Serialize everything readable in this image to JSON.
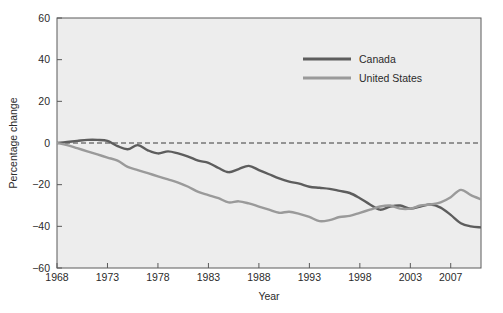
{
  "chart_data": {
    "type": "line",
    "title": "",
    "xlabel": "Year",
    "ylabel": "Percentage change",
    "xlim": [
      1968,
      2010
    ],
    "ylim": [
      -60,
      60
    ],
    "grid": false,
    "legend_position": "top-right",
    "xticks": [
      1968,
      1973,
      1978,
      1983,
      1988,
      1993,
      1998,
      2003,
      2007
    ],
    "xtick_labels": [
      "1968",
      "1973",
      "1978",
      "1983",
      "1988",
      "1993",
      "1998",
      "2003",
      "2007"
    ],
    "yticks": [
      60,
      40,
      20,
      0,
      -20,
      -40,
      -60
    ],
    "ytick_labels": [
      "60",
      "40",
      "20",
      "0",
      "−20",
      "−40",
      "−60"
    ],
    "zero_reference_line": {
      "value": 0,
      "style": "dashed",
      "color": "#3a3a3a"
    },
    "series": [
      {
        "name": "Canada",
        "color": "#5d5d5d",
        "x": [
          1968,
          1969,
          1970,
          1971,
          1972,
          1973,
          1974,
          1975,
          1976,
          1977,
          1978,
          1979,
          1980,
          1981,
          1982,
          1983,
          1984,
          1985,
          1986,
          1987,
          1988,
          1989,
          1990,
          1991,
          1992,
          1993,
          1994,
          1995,
          1996,
          1997,
          1998,
          1999,
          2000,
          2001,
          2002,
          2003,
          2004,
          2005,
          2006,
          2007,
          2008,
          2009,
          2010
        ],
        "values": [
          0,
          0.5,
          1,
          1.5,
          1.5,
          1,
          -1.5,
          -3,
          -1,
          -3.5,
          -5,
          -4,
          -5,
          -6.5,
          -8.5,
          -9.5,
          -12,
          -14,
          -12.5,
          -11,
          -13,
          -15,
          -17,
          -18.5,
          -19.5,
          -21,
          -21.5,
          -22,
          -23,
          -24,
          -26.5,
          -29.5,
          -32,
          -30.5,
          -30,
          -31.5,
          -30.5,
          -29.5,
          -31,
          -34.5,
          -38.5,
          -40,
          -40.5
        ]
      },
      {
        "name": "United States",
        "color": "#9a9a9a",
        "x": [
          1968,
          1969,
          1970,
          1971,
          1972,
          1973,
          1974,
          1975,
          1976,
          1977,
          1978,
          1979,
          1980,
          1981,
          1982,
          1983,
          1984,
          1985,
          1986,
          1987,
          1988,
          1989,
          1990,
          1991,
          1992,
          1993,
          1994,
          1995,
          1996,
          1997,
          1998,
          1999,
          2000,
          2001,
          2002,
          2003,
          2004,
          2005,
          2006,
          2007,
          2008,
          2009,
          2010
        ],
        "values": [
          0,
          -1,
          -2.5,
          -4,
          -5.5,
          -7,
          -8.5,
          -11.5,
          -13,
          -14.5,
          -16,
          -17.5,
          -19,
          -21,
          -23.5,
          -25,
          -26.5,
          -28.5,
          -28,
          -29,
          -30.5,
          -32,
          -33.5,
          -33,
          -34,
          -35.5,
          -37.5,
          -37,
          -35.5,
          -35,
          -33.5,
          -32,
          -30.5,
          -30,
          -31.5,
          -31.5,
          -30,
          -29.5,
          -28.5,
          -26,
          -22.5,
          -25,
          -27
        ]
      }
    ]
  },
  "legend": {
    "items": [
      {
        "label": "Canada",
        "color": "#5d5d5d"
      },
      {
        "label": "United States",
        "color": "#9a9a9a"
      }
    ]
  },
  "axes": {
    "x_title": "Year",
    "y_title": "Percentage change"
  }
}
